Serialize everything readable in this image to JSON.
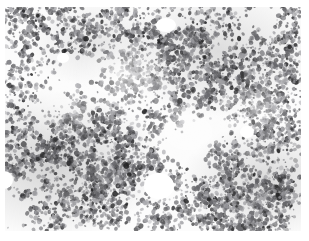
{
  "figure": {
    "kind": "micrograph",
    "modality": "brightfield light microscopy",
    "appearance": "lung parenchyma: lacy alveolar septal network of small dark nuclei on pale background",
    "stain_rendering": "grayscale"
  },
  "canvas": {
    "width": 309,
    "height": 241,
    "margin_top": 7,
    "margin_bottom": 10,
    "margin_left": 5,
    "margin_right": 8,
    "field_width": 296,
    "field_height": 224
  },
  "colors": {
    "page_background": "#ffffff",
    "slide_background": "#fcfcfc",
    "nucleus_dark": "#3a3a3c",
    "nucleus_mid": "#6e6e72",
    "nucleus_light": "#a9a9ad",
    "lumen_clear": "#ffffff"
  },
  "texture": {
    "nuclei_count": 5200,
    "nucleus_min_radius": 0.7,
    "nucleus_max_radius": 2.6,
    "clump_count": 420,
    "clump_spread": 9,
    "seed": 20240917
  },
  "lumina": [
    {
      "name": "central-lower-lumen",
      "cx": 159,
      "cy": 186,
      "rx": 15,
      "ry": 13
    },
    {
      "name": "upper-center-lumen",
      "cx": 166,
      "cy": 25,
      "rx": 10,
      "ry": 7
    },
    {
      "name": "left-edge-lumen",
      "cx": 4,
      "cy": 180,
      "rx": 9,
      "ry": 9
    },
    {
      "name": "mid-right-clearing",
      "cx": 247,
      "cy": 132,
      "rx": 7,
      "ry": 6
    },
    {
      "name": "upper-left-clearing",
      "cx": 63,
      "cy": 58,
      "rx": 6,
      "ry": 5
    }
  ]
}
